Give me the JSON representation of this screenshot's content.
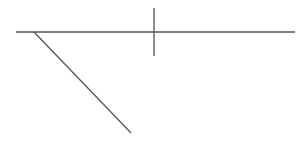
{
  "canvas": {
    "width": 307,
    "height": 144,
    "background": "#ffffff"
  },
  "style": {
    "stroke_color": "#555555",
    "stroke_width": 1.3
  },
  "lines": [
    {
      "name": "horizontal-line",
      "x1": 16,
      "y1": 32,
      "x2": 295,
      "y2": 32
    },
    {
      "name": "vertical-line",
      "x1": 154,
      "y1": 8,
      "x2": 154,
      "y2": 56
    },
    {
      "name": "diagonal-line",
      "x1": 34,
      "y1": 32,
      "x2": 131,
      "y2": 133
    }
  ]
}
